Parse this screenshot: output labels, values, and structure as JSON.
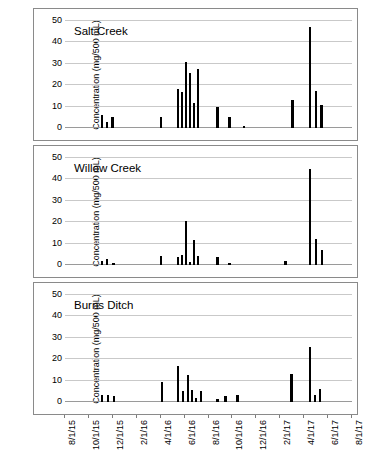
{
  "figure": {
    "ylabel": "Concentration (mg/500 mL)",
    "y_ticks": [
      0,
      10,
      20,
      30,
      40,
      50
    ],
    "x_ticks": [
      "8/1/15",
      "10/1/15",
      "12/1/15",
      "2/1/16",
      "4/1/16",
      "6/1/16",
      "8/1/16",
      "10/1/16",
      "12/1/16",
      "2/1/17",
      "4/1/17",
      "6/1/17",
      "8/1/17"
    ],
    "panel_titles": [
      "Salt Creek",
      "Willow Creek",
      "Burns Ditch"
    ],
    "bar_color": "#000000",
    "grid_color": "#c9c9c9",
    "axis_color": "#8a8a8a"
  },
  "chart_data": [
    {
      "type": "bar",
      "title": "Salt Creek",
      "xlabel": "",
      "ylabel": "Concentration (mg/500 mL)",
      "ylim": [
        0,
        50
      ],
      "yticks": [
        0,
        10,
        20,
        30,
        40,
        50
      ],
      "grid": true,
      "legend": "none",
      "xtick_labels": [
        "8/1/15",
        "10/1/15",
        "12/1/15",
        "2/1/16",
        "4/1/16",
        "6/1/16",
        "8/1/16",
        "10/1/16",
        "12/1/16",
        "2/1/17",
        "4/1/17",
        "6/1/17",
        "8/1/17"
      ],
      "x": [
        9.0,
        10.3,
        11.6,
        23.8,
        28.0,
        29.0,
        30.0,
        31.0,
        32.0,
        33.0,
        38.0,
        41.0,
        44.6,
        56.8,
        61.2,
        62.6,
        64.0
      ],
      "x_units": "months since 8/1/15 scaled to axis",
      "values": [
        5.9,
        2.7,
        5.1,
        5.3,
        18.3,
        17.0,
        30.7,
        25.8,
        11.8,
        27.8,
        9.8,
        5.2,
        0.9,
        13.2,
        47.4,
        17.2,
        10.9
      ]
    },
    {
      "type": "bar",
      "title": "Willow Creek",
      "xlabel": "",
      "ylabel": "Concentration (mg/500 mL)",
      "ylim": [
        0,
        50
      ],
      "yticks": [
        0,
        10,
        20,
        30,
        40,
        50
      ],
      "grid": true,
      "legend": "none",
      "xtick_labels": [
        "8/1/15",
        "10/1/15",
        "12/1/15",
        "2/1/16",
        "4/1/16",
        "6/1/16",
        "8/1/16",
        "10/1/16",
        "12/1/16",
        "2/1/17",
        "4/1/17",
        "6/1/17",
        "8/1/17"
      ],
      "x": [
        9.0,
        10.3,
        11.9,
        23.8,
        28.0,
        29.0,
        30.0,
        31.0,
        32.0,
        33.0,
        38.0,
        41.0,
        55.0,
        61.2,
        62.6,
        64.2
      ],
      "values": [
        1.8,
        2.6,
        0.8,
        4.1,
        3.7,
        4.7,
        20.6,
        1.3,
        11.7,
        4.3,
        3.8,
        0.9,
        1.9,
        45.0,
        12.1,
        7.0
      ]
    },
    {
      "type": "bar",
      "title": "Burns Ditch",
      "xlabel": "",
      "ylabel": "Concentration (mg/500 mL)",
      "ylim": [
        0,
        50
      ],
      "yticks": [
        0,
        10,
        20,
        30,
        40,
        50
      ],
      "grid": true,
      "legend": "none",
      "xtick_labels": [
        "8/1/15",
        "10/1/15",
        "12/1/15",
        "2/1/16",
        "4/1/16",
        "6/1/16",
        "8/1/16",
        "10/1/16",
        "12/1/16",
        "2/1/17",
        "4/1/17",
        "6/1/17",
        "8/1/17"
      ],
      "x": [
        9.0,
        10.5,
        12.0,
        24.0,
        28.0,
        29.3,
        30.5,
        31.6,
        32.6,
        33.8,
        38.0,
        40.0,
        43.0,
        56.5,
        61.2,
        62.4,
        63.6
      ],
      "values": [
        3.2,
        3.3,
        3.0,
        9.2,
        17.0,
        5.0,
        12.5,
        5.6,
        1.8,
        5.3,
        1.6,
        2.6,
        3.2,
        13.0,
        25.7,
        3.2,
        6.2
      ]
    }
  ]
}
